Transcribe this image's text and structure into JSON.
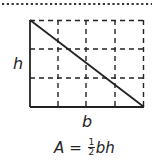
{
  "diagram": {
    "labels": {
      "height": "h",
      "base": "b"
    },
    "formula": {
      "lhs": "A",
      "equals": "=",
      "numerator": "1",
      "denominator": "2",
      "rhs": "bh"
    },
    "grid": {
      "columns": 4,
      "rows": 3
    },
    "colors": {
      "stroke": "#222222",
      "dotted_rule": "#333333",
      "background": "#ffffff"
    }
  }
}
